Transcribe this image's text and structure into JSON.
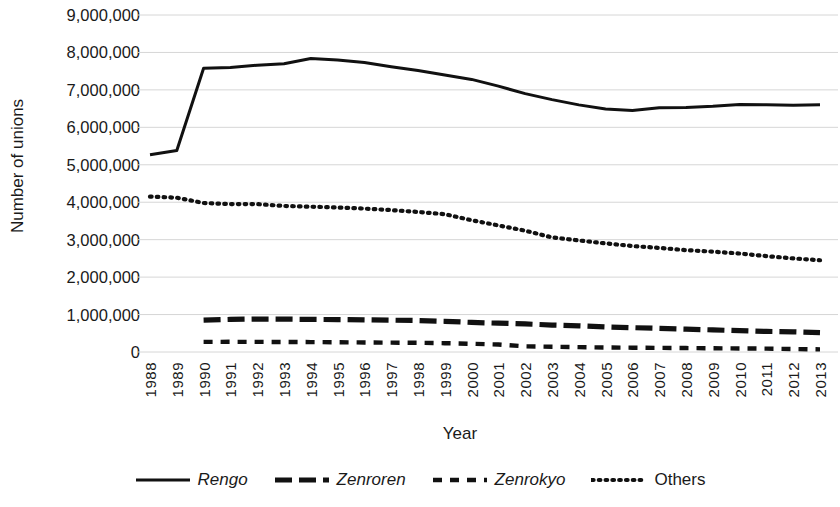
{
  "chart_data": {
    "type": "line",
    "title": "",
    "xlabel": "Year",
    "ylabel": "Number of unions",
    "categories": [
      1988,
      1989,
      1990,
      1991,
      1992,
      1993,
      1994,
      1995,
      1996,
      1997,
      1998,
      1999,
      2000,
      2001,
      2002,
      2003,
      2004,
      2005,
      2006,
      2007,
      2008,
      2009,
      2010,
      2011,
      2012,
      2013
    ],
    "x_tick_labels": [
      "1988",
      "1989",
      "1990",
      "1991",
      "1992",
      "1993",
      "1994",
      "1995",
      "1996",
      "1997",
      "1998",
      "1999",
      "2000",
      "2001",
      "2002",
      "2003",
      "2004",
      "2005",
      "2006",
      "2007",
      "2008",
      "2009",
      "2010",
      "2011",
      "2012",
      "2013"
    ],
    "y_tick_labels": [
      "9,000,000",
      "8,000,000",
      "7,000,000",
      "6,000,000",
      "5,000,000",
      "4,000,000",
      "3,000,000",
      "2,000,000",
      "1,000,000",
      "0"
    ],
    "y_tick_values": [
      9000000,
      8000000,
      7000000,
      6000000,
      5000000,
      4000000,
      3000000,
      2000000,
      1000000,
      0
    ],
    "ylim": [
      0,
      9000000
    ],
    "xlim": [
      1988,
      2013
    ],
    "grid": true,
    "legend_position": "bottom",
    "series": [
      {
        "name": "Rengo",
        "style": "solid",
        "italic": true,
        "color": "#111111",
        "values": [
          5270000,
          5380000,
          7580000,
          7600000,
          7660000,
          7700000,
          7840000,
          7800000,
          7730000,
          7620000,
          7520000,
          7400000,
          7280000,
          7100000,
          6900000,
          6740000,
          6600000,
          6490000,
          6450000,
          6520000,
          6530000,
          6560000,
          6610000,
          6600000,
          6590000,
          6600000
        ]
      },
      {
        "name": "Zenroren",
        "style": "long-dash",
        "italic": true,
        "color": "#111111",
        "values": [
          null,
          null,
          850000,
          870000,
          880000,
          878000,
          870000,
          866000,
          860000,
          850000,
          840000,
          820000,
          790000,
          770000,
          750000,
          720000,
          700000,
          670000,
          650000,
          630000,
          610000,
          590000,
          570000,
          550000,
          540000,
          520000
        ]
      },
      {
        "name": "Zenrokyo",
        "style": "short-dash",
        "italic": true,
        "color": "#111111",
        "values": [
          null,
          null,
          270000,
          272000,
          270000,
          268000,
          265000,
          260000,
          255000,
          250000,
          245000,
          235000,
          220000,
          200000,
          150000,
          140000,
          130000,
          120000,
          115000,
          110000,
          105000,
          100000,
          95000,
          90000,
          80000,
          70000
        ]
      },
      {
        "name": "Others",
        "style": "dotted",
        "italic": false,
        "color": "#111111",
        "values": [
          4150000,
          4120000,
          3980000,
          3950000,
          3950000,
          3900000,
          3880000,
          3860000,
          3830000,
          3790000,
          3740000,
          3680000,
          3520000,
          3380000,
          3240000,
          3060000,
          2980000,
          2900000,
          2830000,
          2780000,
          2720000,
          2680000,
          2630000,
          2560000,
          2500000,
          2450000
        ]
      }
    ]
  },
  "axes": {
    "y_title": "Number of unions",
    "x_title": "Year"
  },
  "legend": {
    "items": [
      {
        "label": "Rengo",
        "style": "solid"
      },
      {
        "label": "Zenroren",
        "style": "long-dash"
      },
      {
        "label": "Zenrokyo",
        "style": "short-dash"
      },
      {
        "label": "Others",
        "style": "dotted"
      }
    ]
  },
  "colors": {
    "ink": "#111111",
    "grid": "#d6d6d6",
    "background": "#ffffff"
  }
}
